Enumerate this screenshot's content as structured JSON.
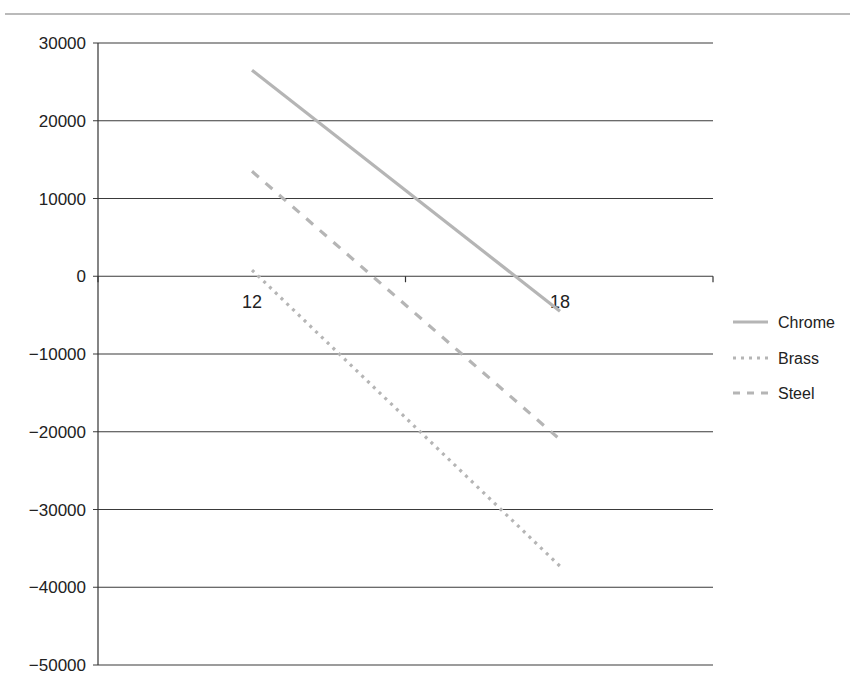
{
  "chart_data": {
    "type": "line",
    "title": "",
    "xlabel": "",
    "ylabel": "",
    "categories": [
      "12",
      "18"
    ],
    "series": [
      {
        "name": "Chrome",
        "values": [
          26500,
          -4500
        ],
        "style": "solid",
        "color": "#b5b5b5"
      },
      {
        "name": "Brass",
        "values": [
          800,
          -37300
        ],
        "style": "dotted",
        "color": "#b5b5b5"
      },
      {
        "name": "Steel",
        "values": [
          13500,
          -21000
        ],
        "style": "dashed",
        "color": "#b5b5b5"
      }
    ],
    "ylim": [
      -50000,
      30000
    ],
    "yticks": [
      30000,
      20000,
      10000,
      0,
      -10000,
      20000,
      -30000,
      -40000,
      -50000
    ],
    "ytick_labels": [
      "30000",
      "20000",
      "10000",
      "0",
      "−10000",
      "−20000",
      "−30000",
      "−40000",
      "−50000"
    ],
    "grid": true,
    "legend_position": "right",
    "x_axis_at": 0
  },
  "layout": {
    "plot_left": 98,
    "plot_right": 713,
    "y_top_px": 43,
    "y_bottom_px": 665,
    "cat_x": [
      252,
      560
    ],
    "top_rule_y": 14,
    "gridline_color": "#3a3a3a",
    "axis_color": "#333333"
  },
  "legend": {
    "items": [
      {
        "label": "Chrome",
        "style": "solid"
      },
      {
        "label": "Brass",
        "style": "dotted"
      },
      {
        "label": "Steel",
        "style": "dashed"
      }
    ]
  }
}
